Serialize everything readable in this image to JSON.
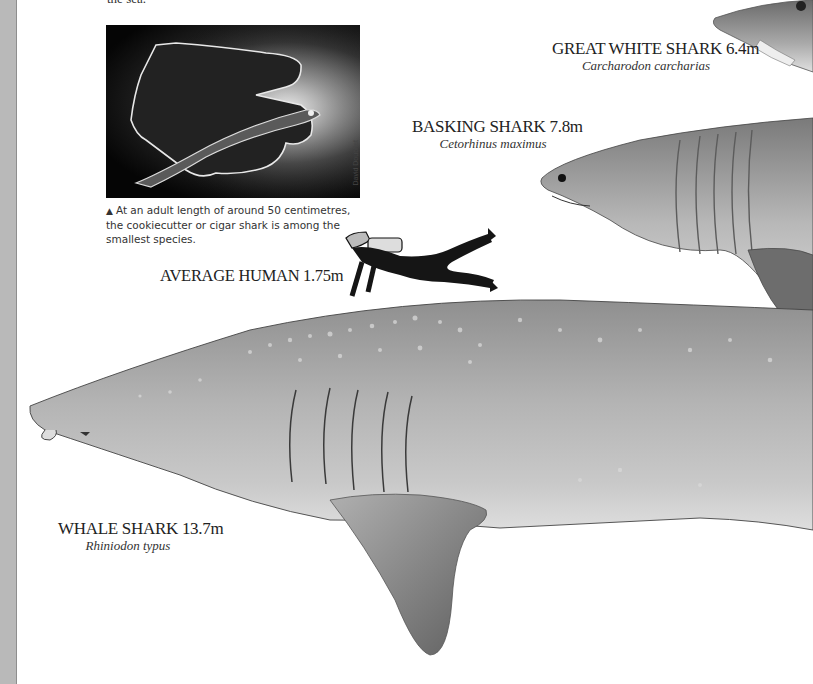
{
  "page": {
    "intro_fragment": "the sea.",
    "photo": {
      "alt": "Cookiecutter shark held in a diver's gloved hand, backlit underwater",
      "credit": "David Doubilet"
    },
    "caption": {
      "marker": "▲",
      "text": "At an adult length of around 50 centimetres, the cookiecutter or cigar shark is among the smallest species."
    },
    "species": [
      {
        "id": "great-white",
        "common_name": "GREAT WHITE SHARK",
        "length": "6.4m",
        "latin_name": "Carcharodon carcharias"
      },
      {
        "id": "basking",
        "common_name": "BASKING SHARK",
        "length": "7.8m",
        "latin_name": "Cetorhinus maximus"
      },
      {
        "id": "human",
        "common_name": "AVERAGE HUMAN",
        "length": "1.75m",
        "latin_name": ""
      },
      {
        "id": "whale",
        "common_name": "WHALE SHARK",
        "length": "13.7m",
        "latin_name": "Rhiniodon typus"
      }
    ],
    "labels": {
      "great_white": "GREAT WHITE SHARK 6.4m",
      "great_white_latin": "Carcharodon carcharias",
      "basking": "BASKING SHARK 7.8m",
      "basking_latin": "Cetorhinus maximus",
      "human": "AVERAGE HUMAN 1.75m",
      "whale": "WHALE SHARK 13.7m",
      "whale_latin": "Rhiniodon typus"
    },
    "colors": {
      "gutter": "#b9b9b9",
      "shark_gray": "#a9a9a9",
      "shark_dark": "#6e6e6e"
    }
  }
}
